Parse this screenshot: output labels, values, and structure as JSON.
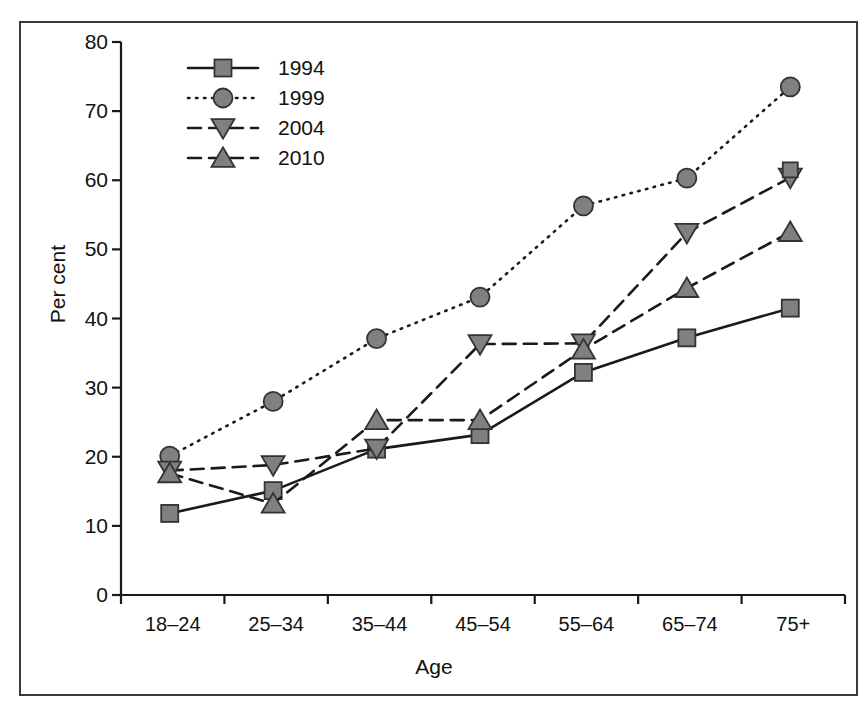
{
  "chart_data": {
    "type": "line",
    "title": "",
    "xlabel": "Age",
    "ylabel": "Per cent",
    "categories": [
      "18–24",
      "25–34",
      "35–44",
      "45–54",
      "55–64",
      "65–74",
      "75+"
    ],
    "ylim": [
      0,
      80
    ],
    "yticks": [
      0,
      10,
      20,
      30,
      40,
      50,
      60,
      70,
      80
    ],
    "grid": false,
    "legend_position": "upper-left-inside",
    "series": [
      {
        "name": "1994",
        "marker": "square",
        "linestyle": "solid",
        "values": [
          11.8,
          15.1,
          21.1,
          23.2,
          32.2,
          37.2,
          41.5
        ]
      },
      {
        "name": "1999",
        "marker": "circle",
        "linestyle": "dotted",
        "values": [
          20.1,
          28.0,
          37.1,
          43.1,
          56.3,
          60.3,
          73.5
        ]
      },
      {
        "name": "2004",
        "marker": "triangle-down",
        "linestyle": "dashed",
        "values": [
          18.0,
          18.8,
          21.2,
          36.3,
          36.4,
          52.4,
          60.4
        ]
      },
      {
        "name": "2010",
        "marker": "triangle-up",
        "linestyle": "dashed",
        "values": [
          17.6,
          13.2,
          25.3,
          25.3,
          35.5,
          44.4,
          52.5
        ]
      }
    ],
    "extra_points": [
      {
        "series": "1994",
        "category": "75+",
        "value": 61.5,
        "marker": "square",
        "detached": true
      }
    ],
    "colors": {
      "marker_fill": "#808080",
      "marker_edge": "#333333",
      "line": "#1a1a1a",
      "axis": "#1a1a1a",
      "frame": "#3a3a3a",
      "background": "#ffffff",
      "text": "#111111"
    }
  },
  "legend": {
    "entries": [
      {
        "label": "1994"
      },
      {
        "label": "1999"
      },
      {
        "label": "2004"
      },
      {
        "label": "2010"
      }
    ]
  }
}
